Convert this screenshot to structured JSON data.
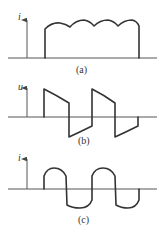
{
  "figure": {
    "panels": [
      {
        "id": "a",
        "caption": "(a)",
        "y_axis_label": "i",
        "waveform": "rectified current with scalloped ripple top (4 arcs)"
      },
      {
        "id": "b",
        "caption": "(b)",
        "y_axis_label": "u",
        "waveform": "alternating square-like voltage with exponential decay on each half-cycle"
      },
      {
        "id": "c",
        "caption": "(c)",
        "y_axis_label": "i",
        "waveform": "alternating current with rounded humps each half-cycle"
      }
    ],
    "colors": {
      "line": "#333333",
      "axis": "#555555",
      "background": "#ffffff"
    }
  }
}
